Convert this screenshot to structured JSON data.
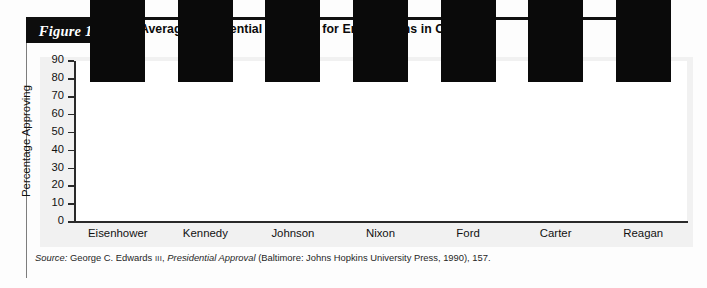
{
  "figure": {
    "label": "Figure 13.4",
    "title": "Average Presidential Approval for Entire Terms in Office"
  },
  "source": {
    "prefix": "Source:",
    "author": "George C. Edwards",
    "author_suffix": "III",
    "work": "Presidential Approval",
    "publication": "(Baltimore: Johns Hopkins University Press, 1990), 157."
  },
  "colors": {
    "bar": "#0a0a0a",
    "label_box": "#0d0d0d",
    "axis": "#2a2a2a",
    "plot_background": "#ffffff",
    "chart_background": "#f1f1f1"
  },
  "chart_data": {
    "type": "bar",
    "title": "Average Presidential Approval for Entire Terms in Office",
    "xlabel": "",
    "ylabel": "Percentage Approving",
    "categories": [
      "Eisenhower",
      "Kennedy",
      "Johnson",
      "Nixon",
      "Ford",
      "Carter",
      "Reagan"
    ],
    "values": [
      65,
      71,
      56,
      48,
      47,
      47,
      52
    ],
    "value_labels": [
      "65%",
      "71%",
      "56%",
      "48%",
      "47%",
      "47%",
      "52%"
    ],
    "ylim": [
      0,
      90
    ],
    "yticks": [
      0,
      10,
      20,
      30,
      40,
      50,
      60,
      70,
      80,
      90
    ],
    "ytick_labels": [
      "0",
      "10",
      "20",
      "30",
      "40",
      "50",
      "60",
      "70",
      "80",
      "90"
    ],
    "grid": false,
    "legend": false
  }
}
